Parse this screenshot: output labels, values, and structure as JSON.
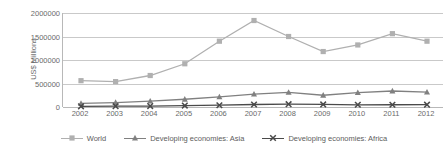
{
  "chart_data": {
    "type": "line",
    "title": "",
    "xlabel": "",
    "ylabel": "US$ Millions",
    "categories": [
      "2002",
      "2003",
      "2004",
      "2005",
      "2006",
      "2007",
      "2008",
      "2009",
      "2010",
      "2011",
      "2012"
    ],
    "ylim": [
      0,
      2000000
    ],
    "yticks": [
      0,
      500000,
      1000000,
      1500000,
      2000000
    ],
    "ytick_labels": [
      "0",
      "500000",
      "1000000",
      "1500000",
      "2000000"
    ],
    "grid": true,
    "legend_position": "bottom",
    "series": [
      {
        "name": "World",
        "color": "#b0b0b0",
        "marker": "square",
        "values": [
          560000,
          540000,
          670000,
          920000,
          1400000,
          1840000,
          1500000,
          1180000,
          1320000,
          1560000,
          1400000
        ]
      },
      {
        "name": "Developing economies: Asia",
        "color": "#808080",
        "marker": "triangle",
        "values": [
          75000,
          95000,
          125000,
          165000,
          215000,
          275000,
          310000,
          250000,
          305000,
          340000,
          315000
        ]
      },
      {
        "name": "Developing economies: Africa",
        "color": "#4a4a4a",
        "marker": "x",
        "values": [
          14000,
          18000,
          20000,
          30000,
          38000,
          53000,
          60000,
          55000,
          47000,
          48000,
          50000
        ]
      }
    ]
  },
  "axis": {
    "y_title": "US$ Millions"
  },
  "legend": {
    "items": [
      {
        "label": "World"
      },
      {
        "label": "Developing economies: Asia"
      },
      {
        "label": "Developing economies: Africa"
      }
    ]
  }
}
